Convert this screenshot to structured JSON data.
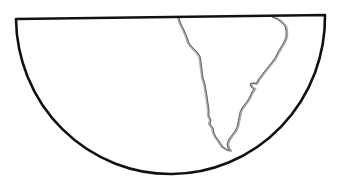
{
  "map": {
    "projection_shape": "half-disc",
    "region": "South America",
    "colors": {
      "background": "#ffffff",
      "frame_stroke": "#111111",
      "coastline_stroke": "#555555",
      "coastline_stipple": "#aaaaaa"
    },
    "frame": {
      "top_left": [
        16,
        19
      ],
      "top_right": [
        325,
        15
      ],
      "bottom_point": [
        170,
        174
      ],
      "stroke_width": 2.6
    },
    "coastline": {
      "west_coast": [
        [
          179,
          18
        ],
        [
          181,
          24
        ],
        [
          184,
          30
        ],
        [
          187,
          37
        ],
        [
          189,
          43
        ],
        [
          192,
          47
        ],
        [
          197,
          52
        ],
        [
          200,
          56
        ],
        [
          201,
          62
        ],
        [
          202,
          70
        ],
        [
          203,
          78
        ],
        [
          205,
          84
        ],
        [
          206,
          90
        ],
        [
          207,
          96
        ],
        [
          208,
          103
        ],
        [
          209,
          110
        ],
        [
          209,
          116
        ],
        [
          211,
          120
        ],
        [
          210,
          124
        ],
        [
          213,
          128
        ],
        [
          214,
          133
        ],
        [
          216,
          137
        ],
        [
          219,
          141
        ],
        [
          221,
          144
        ],
        [
          223,
          147
        ],
        [
          226,
          149
        ],
        [
          228,
          150
        ],
        [
          230,
          151
        ]
      ],
      "east_coast": [
        [
          230,
          151
        ],
        [
          228,
          148
        ],
        [
          227,
          144
        ],
        [
          229,
          139
        ],
        [
          232,
          135
        ],
        [
          235,
          131
        ],
        [
          237,
          127
        ],
        [
          238,
          122
        ],
        [
          239,
          117
        ],
        [
          240,
          112
        ],
        [
          242,
          108
        ],
        [
          245,
          104
        ],
        [
          248,
          100
        ],
        [
          250,
          96
        ],
        [
          252,
          92
        ],
        [
          254,
          89
        ],
        [
          251,
          87
        ],
        [
          250,
          84
        ],
        [
          253,
          83
        ],
        [
          256,
          84
        ],
        [
          258,
          80
        ],
        [
          261,
          76
        ],
        [
          264,
          72
        ],
        [
          268,
          67
        ],
        [
          272,
          62
        ],
        [
          275,
          58
        ],
        [
          278,
          52
        ],
        [
          281,
          47
        ],
        [
          284,
          42
        ],
        [
          286,
          37
        ],
        [
          286,
          31
        ],
        [
          285,
          26
        ],
        [
          281,
          22
        ],
        [
          277,
          19
        ],
        [
          272,
          17
        ]
      ]
    }
  }
}
